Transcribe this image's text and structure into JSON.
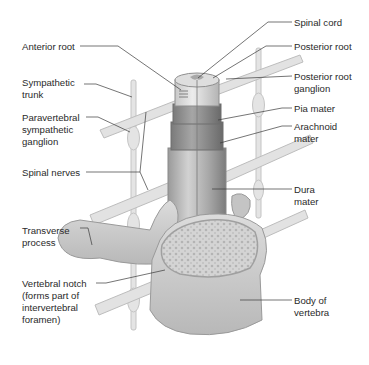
{
  "figure": {
    "labels_left": [
      {
        "id": "anterior-root",
        "text": "Anterior root",
        "x": 22,
        "y": 41
      },
      {
        "id": "sympathetic-trunk",
        "text": "Sympathetic\ntrunk",
        "x": 22,
        "y": 77
      },
      {
        "id": "paravertebral-ganglion",
        "text": "Paravertebral\nsympathetic\nganglion",
        "x": 22,
        "y": 113
      },
      {
        "id": "spinal-nerves",
        "text": "Spinal nerves",
        "x": 22,
        "y": 167
      },
      {
        "id": "transverse-process",
        "text": "Transverse\nprocess",
        "x": 22,
        "y": 225
      },
      {
        "id": "vertebral-notch",
        "text": "Vertebral notch\n(forms part of\nintervertebral\nforamen)",
        "x": 22,
        "y": 277
      }
    ],
    "labels_right": [
      {
        "id": "spinal-cord",
        "text": "Spinal cord",
        "x": 294,
        "y": 17
      },
      {
        "id": "posterior-root",
        "text": "Posterior root",
        "x": 294,
        "y": 41
      },
      {
        "id": "posterior-root-ganglion",
        "text": "Posterior root\nganglion",
        "x": 294,
        "y": 71
      },
      {
        "id": "pia-mater",
        "text": "Pia mater",
        "x": 294,
        "y": 103
      },
      {
        "id": "arachnoid-mater",
        "text": "Arachnoid\nmater",
        "x": 294,
        "y": 121
      },
      {
        "id": "dura-mater",
        "text": "Dura\nmater",
        "x": 294,
        "y": 184
      },
      {
        "id": "body-of-vertebra",
        "text": "Body of\nvertebra",
        "x": 294,
        "y": 295
      }
    ]
  }
}
